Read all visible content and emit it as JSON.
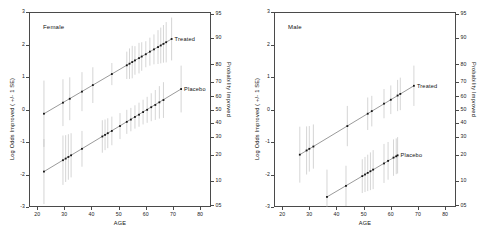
{
  "figure": {
    "panels": [
      {
        "id": "female",
        "label": "Female",
        "xlabel": "AGE",
        "ylabel": "Log Odds Improved ( +/- 1 SE)",
        "ylabel_right": "Probability Improved",
        "xticks": [
          "20",
          "30",
          "40",
          "50",
          "60",
          "70",
          "80"
        ],
        "yticks": [
          "3",
          "2",
          "1",
          "0",
          "-1",
          "-2",
          "-3"
        ],
        "yticks_right": [
          "95",
          "90",
          "80",
          "70",
          "60",
          "50",
          "40",
          "30",
          "20",
          "10",
          "05"
        ],
        "series_labels": {
          "treated": "Treated",
          "placebo": "Placebo"
        }
      },
      {
        "id": "male",
        "label": "Male",
        "xlabel": "AGE",
        "ylabel": "Log Odds Improved ( +/- 1 SE)",
        "ylabel_right": "Probability Improved",
        "xticks": [
          "20",
          "30",
          "40",
          "50",
          "60",
          "70",
          "80"
        ],
        "yticks": [
          "3",
          "2",
          "1",
          "0",
          "-1",
          "-2",
          "-3"
        ],
        "yticks_right": [
          "95",
          "90",
          "80",
          "70",
          "60",
          "50",
          "40",
          "30",
          "20",
          "10",
          "05"
        ],
        "series_labels": {
          "treated": "Treated",
          "placebo": "Placebo"
        }
      }
    ]
  },
  "chart_data": [
    {
      "type": "scatter",
      "title": "Female",
      "xlabel": "AGE",
      "ylabel": "Log Odds Improved ( +/- 1 SE)",
      "ylabel_right": "Probability Improved",
      "xlim": [
        17,
        84
      ],
      "ylim": [
        -3,
        3
      ],
      "xticks": [
        20,
        30,
        40,
        50,
        60,
        70,
        80
      ],
      "yticks": [
        -3,
        -2,
        -1,
        0,
        1,
        2,
        3
      ],
      "right_axis_ticks_probability": [
        95,
        90,
        80,
        70,
        60,
        50,
        40,
        30,
        20,
        10,
        5
      ],
      "right_axis_tick_logodds": [
        2.944,
        2.197,
        1.386,
        0.847,
        0.405,
        0.0,
        -0.405,
        -0.847,
        -1.386,
        -2.197,
        -2.944
      ],
      "grid": false,
      "legend": "inline annotations at line ends",
      "series": [
        {
          "name": "Treated",
          "fit_line": {
            "x": [
              22.5,
              69.5
            ],
            "y": [
              -0.13,
              2.17
            ],
            "slope": 0.0489,
            "intercept": -1.231
          },
          "points": [
            {
              "x": 22.5,
              "y": -0.13,
              "se": 1.02
            },
            {
              "x": 29.5,
              "y": 0.21,
              "se": 0.72
            },
            {
              "x": 32.0,
              "y": 0.33,
              "se": 0.66
            },
            {
              "x": 36.5,
              "y": 0.55,
              "se": 0.6
            },
            {
              "x": 40.5,
              "y": 0.75,
              "se": 0.55
            },
            {
              "x": 47.5,
              "y": 1.09,
              "se": 0.34
            },
            {
              "x": 53.0,
              "y": 1.36,
              "se": 0.42
            },
            {
              "x": 54.0,
              "y": 1.41,
              "se": 0.47
            },
            {
              "x": 55.0,
              "y": 1.46,
              "se": 0.5
            },
            {
              "x": 56.0,
              "y": 1.51,
              "se": 0.44
            },
            {
              "x": 57.5,
              "y": 1.58,
              "se": 0.47
            },
            {
              "x": 58.5,
              "y": 1.63,
              "se": 0.44
            },
            {
              "x": 60.0,
              "y": 1.7,
              "se": 0.4
            },
            {
              "x": 61.5,
              "y": 1.78,
              "se": 0.43
            },
            {
              "x": 63.0,
              "y": 1.85,
              "se": 0.46
            },
            {
              "x": 64.5,
              "y": 1.92,
              "se": 0.52
            },
            {
              "x": 65.5,
              "y": 1.97,
              "se": 0.55
            },
            {
              "x": 66.5,
              "y": 2.02,
              "se": 0.58
            },
            {
              "x": 67.5,
              "y": 2.07,
              "se": 0.62
            },
            {
              "x": 69.5,
              "y": 2.17,
              "se": 0.66
            }
          ]
        },
        {
          "name": "Placebo",
          "fit_line": {
            "x": [
              22.5,
              73.0
            ],
            "y": [
              -1.91,
              0.63
            ],
            "slope": 0.0503,
            "intercept": -3.042
          },
          "points": [
            {
              "x": 22.5,
              "y": -1.91,
              "se": 1.0
            },
            {
              "x": 29.5,
              "y": -1.56,
              "se": 0.76
            },
            {
              "x": 30.5,
              "y": -1.51,
              "se": 0.72
            },
            {
              "x": 31.5,
              "y": -1.46,
              "se": 0.7
            },
            {
              "x": 32.5,
              "y": -1.41,
              "se": 0.68
            },
            {
              "x": 36.5,
              "y": -1.21,
              "se": 0.55
            },
            {
              "x": 44.0,
              "y": -0.83,
              "se": 0.5
            },
            {
              "x": 45.0,
              "y": -0.78,
              "se": 0.47
            },
            {
              "x": 46.0,
              "y": -0.73,
              "se": 0.46
            },
            {
              "x": 47.5,
              "y": -0.66,
              "se": 0.44
            },
            {
              "x": 50.5,
              "y": -0.51,
              "se": 0.4
            },
            {
              "x": 53.0,
              "y": -0.38,
              "se": 0.37
            },
            {
              "x": 54.5,
              "y": -0.31,
              "se": 0.36
            },
            {
              "x": 56.0,
              "y": -0.23,
              "se": 0.36
            },
            {
              "x": 57.5,
              "y": -0.16,
              "se": 0.37
            },
            {
              "x": 59.0,
              "y": -0.08,
              "se": 0.38
            },
            {
              "x": 60.5,
              "y": -0.01,
              "se": 0.4
            },
            {
              "x": 62.0,
              "y": 0.07,
              "se": 0.43
            },
            {
              "x": 63.5,
              "y": 0.14,
              "se": 0.46
            },
            {
              "x": 65.0,
              "y": 0.22,
              "se": 0.5
            },
            {
              "x": 66.5,
              "y": 0.29,
              "se": 0.55
            },
            {
              "x": 73.0,
              "y": 0.63,
              "se": 0.72
            }
          ]
        }
      ]
    },
    {
      "type": "scatter",
      "title": "Male",
      "xlabel": "AGE",
      "ylabel": "Log Odds Improved ( +/- 1 SE)",
      "ylabel_right": "Probability Improved",
      "xlim": [
        17,
        84
      ],
      "ylim": [
        -3,
        3
      ],
      "xticks": [
        20,
        30,
        40,
        50,
        60,
        70,
        80
      ],
      "yticks": [
        -3,
        -2,
        -1,
        0,
        1,
        2,
        3
      ],
      "right_axis_ticks_probability": [
        95,
        90,
        80,
        70,
        60,
        50,
        40,
        30,
        20,
        10,
        5
      ],
      "right_axis_tick_logodds": [
        2.944,
        2.197,
        1.386,
        0.847,
        0.405,
        0.0,
        -0.405,
        -0.847,
        -1.386,
        -2.197,
        -2.944
      ],
      "grid": false,
      "legend": "inline annotations at line ends",
      "series": [
        {
          "name": "Treated",
          "fit_line": {
            "x": [
              26.5,
              68.5
            ],
            "y": [
              -1.39,
              0.73
            ],
            "slope": 0.0505,
            "intercept": -2.728
          },
          "points": [
            {
              "x": 26.5,
              "y": -1.39,
              "se": 0.86
            },
            {
              "x": 29.0,
              "y": -1.26,
              "se": 0.74
            },
            {
              "x": 30.0,
              "y": -1.21,
              "se": 0.7
            },
            {
              "x": 31.5,
              "y": -1.14,
              "se": 0.68
            },
            {
              "x": 44.0,
              "y": -0.51,
              "se": 0.62
            },
            {
              "x": 51.5,
              "y": -0.13,
              "se": 0.5
            },
            {
              "x": 53.0,
              "y": -0.05,
              "se": 0.47
            },
            {
              "x": 57.5,
              "y": 0.18,
              "se": 0.45
            },
            {
              "x": 60.0,
              "y": 0.3,
              "se": 0.44
            },
            {
              "x": 62.5,
              "y": 0.43,
              "se": 0.48
            },
            {
              "x": 63.5,
              "y": 0.48,
              "se": 0.5
            },
            {
              "x": 68.5,
              "y": 0.73,
              "se": 0.62
            }
          ]
        },
        {
          "name": "Placebo",
          "fit_line": {
            "x": [
              36.5,
              62.5
            ],
            "y": [
              -2.69,
              -1.41
            ],
            "slope": 0.0492,
            "intercept": -4.486
          },
          "points": [
            {
              "x": 36.5,
              "y": -2.69,
              "se": 0.84
            },
            {
              "x": 43.5,
              "y": -2.35,
              "se": 0.62
            },
            {
              "x": 49.5,
              "y": -2.05,
              "se": 0.52
            },
            {
              "x": 50.5,
              "y": -2.0,
              "se": 0.54
            },
            {
              "x": 51.5,
              "y": -1.95,
              "se": 0.56
            },
            {
              "x": 52.5,
              "y": -1.9,
              "se": 0.58
            },
            {
              "x": 53.5,
              "y": -1.85,
              "se": 0.6
            },
            {
              "x": 57.5,
              "y": -1.66,
              "se": 0.6
            },
            {
              "x": 59.0,
              "y": -1.58,
              "se": 0.58
            },
            {
              "x": 61.0,
              "y": -1.48,
              "se": 0.56
            },
            {
              "x": 62.0,
              "y": -1.44,
              "se": 0.55
            },
            {
              "x": 62.5,
              "y": -1.41,
              "se": 0.56
            }
          ]
        }
      ]
    }
  ],
  "colors": {
    "axis": "#4a4a4a",
    "point": "#151515",
    "line": "#555555",
    "errorbar": "#b9b9b9",
    "text": "#111111",
    "background": "#ffffff"
  }
}
